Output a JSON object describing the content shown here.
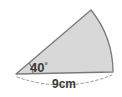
{
  "figure": {
    "type": "circular-sector",
    "background_color": "#ffffff",
    "fill_color": "#d8d8d8",
    "stroke_color": "#7a7a7a",
    "text_color": "#3a3a3a",
    "dash_color": "#9a9a9a"
  },
  "labels": {
    "angle": {
      "value": "40",
      "unit": "°",
      "full": "40°"
    },
    "radius": {
      "value": "9",
      "unit": "cm",
      "full": "9cm"
    }
  },
  "geometry": {
    "apex": {
      "x": 16,
      "y": 74
    },
    "arc_start": {
      "x": 91,
      "y": 10
    },
    "arc_end": {
      "x": 113,
      "y": 72
    },
    "arc_radius": 99,
    "angle_mark_radius": 17,
    "dashed_arc_sag": 10
  }
}
